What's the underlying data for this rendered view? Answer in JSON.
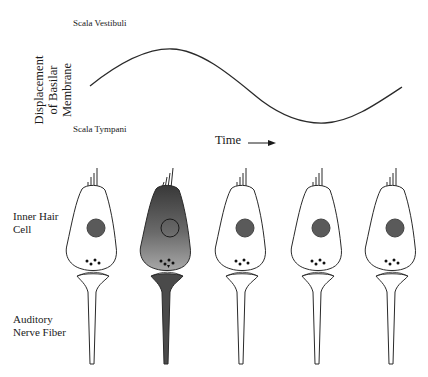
{
  "labels": {
    "scala_vestibuli": "Scala Vestibuli",
    "scala_tympani": "Scala Tympani",
    "y_axis": [
      "Displacement",
      "of Basilar",
      "Membrane"
    ],
    "time": "Time",
    "inner_hair_cell": [
      "Inner Hair",
      "Cell"
    ],
    "auditory_nerve_fiber": [
      "Auditory",
      "Nerve Fiber"
    ]
  },
  "waveform": {
    "description": "Sinusoidal displacement of basilar membrane over time",
    "start": [
      90,
      86
    ],
    "peak": [
      170,
      49
    ],
    "trough": [
      325,
      123
    ],
    "end": [
      402,
      87
    ],
    "stroke": "#2a2a2a"
  },
  "cells": [
    {
      "id": 1,
      "cx": 92,
      "active": false
    },
    {
      "id": 2,
      "cx": 166,
      "active": true
    },
    {
      "id": 3,
      "cx": 241,
      "active": false
    },
    {
      "id": 4,
      "cx": 317,
      "active": false
    },
    {
      "id": 5,
      "cx": 391,
      "active": false
    }
  ],
  "colors": {
    "outline": "#2a2a2a",
    "nucleus": "#5a5a5a",
    "active_top": "#3e3e3e",
    "active_bottom": "#9a9a9a",
    "active_fiber": "#4a4a4a",
    "vesicle": "#111111"
  }
}
